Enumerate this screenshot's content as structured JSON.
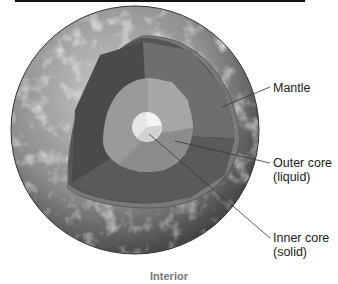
{
  "figure": {
    "caption": "Interior",
    "labels": {
      "mantle": "Mantle",
      "outer_core_1": "Outer core",
      "outer_core_2": "(liquid)",
      "inner_core_1": "Inner core",
      "inner_core_2": "(solid)"
    },
    "colors": {
      "crust": "#7a7a7a",
      "mantle_dark": "#4a4a4a",
      "mantle_mid": "#6a6a6a",
      "outer_core": "#9a9a9a",
      "inner_core": "#e6e6e6"
    }
  }
}
